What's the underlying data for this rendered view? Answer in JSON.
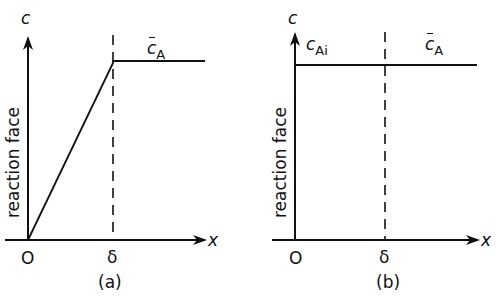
{
  "figure": {
    "panels": [
      {
        "id": "a",
        "caption": "(a)",
        "y_axis_label": "c",
        "x_axis_label": "x",
        "side_label": "reaction face",
        "origin_label": "O",
        "delta_label": "δ",
        "curve_label_main": "c",
        "curve_label_sub": "A",
        "curve_label_bar": true,
        "description": "Linear concentration rise from 0 at the reaction face to c̄A at x = δ, constant beyond"
      },
      {
        "id": "b",
        "caption": "(b)",
        "y_axis_label": "c",
        "x_axis_label": "x",
        "side_label": "reaction face",
        "origin_label": "O",
        "delta_label": "δ",
        "interface_label_main": "c",
        "interface_label_sub": "Ai",
        "curve_label_main": "c",
        "curve_label_sub": "A",
        "curve_label_bar": true,
        "description": "Uniform concentration cAi = c̄A across the film"
      }
    ],
    "line_color": "#111111",
    "background": "#ffffff"
  }
}
